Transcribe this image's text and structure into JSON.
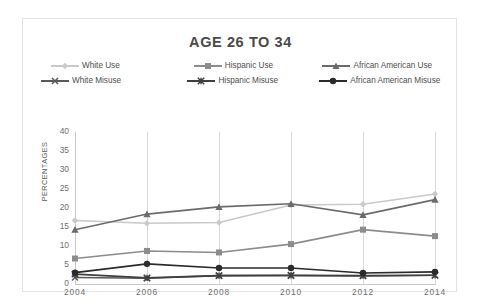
{
  "chart_data": {
    "type": "line",
    "title": "AGE 26 TO 34",
    "xlabel": "",
    "ylabel": "PERCENTAGES",
    "categories": [
      "2004",
      "2006",
      "2008",
      "2010",
      "2012",
      "2014"
    ],
    "x": [
      2004,
      2006,
      2008,
      2010,
      2012,
      2014
    ],
    "ylim": [
      0,
      40
    ],
    "yticks": [
      "0",
      "5",
      "10",
      "15",
      "20",
      "25",
      "30",
      "35",
      "40"
    ],
    "grid": "vertical",
    "legend_position": "top",
    "series": [
      {
        "name": "White Use",
        "marker": "diamond",
        "color": "#c9c9c9",
        "values": [
          16.7,
          16.0,
          16.2,
          20.8,
          21.0,
          23.7
        ]
      },
      {
        "name": "Hispanic Use",
        "marker": "square",
        "color": "#8c8c8c",
        "values": [
          6.7,
          8.7,
          8.3,
          10.5,
          14.3,
          12.6
        ]
      },
      {
        "name": "African American Use",
        "marker": "triangle",
        "color": "#6b6b6b",
        "values": [
          14.3,
          18.4,
          20.3,
          21.1,
          18.2,
          22.2
        ]
      },
      {
        "name": "White Misuse",
        "marker": "cross",
        "color": "#5a5a5a",
        "values": [
          1.7,
          1.5,
          2.2,
          2.2,
          2.1,
          2.3
        ]
      },
      {
        "name": "Hispanic Misuse",
        "marker": "star",
        "color": "#3f3f3f",
        "values": [
          2.6,
          1.6,
          2.2,
          2.3,
          2.2,
          2.3
        ]
      },
      {
        "name": "African American Misuse",
        "marker": "circle",
        "color": "#2b2b2b",
        "values": [
          3.0,
          5.3,
          4.2,
          4.2,
          2.9,
          3.2
        ]
      }
    ]
  },
  "legend": {
    "rows": [
      [
        {
          "label": "White Use",
          "series": 0
        },
        {
          "label": "Hispanic Use",
          "series": 1
        },
        {
          "label": "African American Use",
          "series": 2
        }
      ],
      [
        {
          "label": "White Misuse",
          "series": 3
        },
        {
          "label": "Hispanic Misuse",
          "series": 4
        },
        {
          "label": "African American Misuse",
          "series": 5
        }
      ]
    ]
  }
}
